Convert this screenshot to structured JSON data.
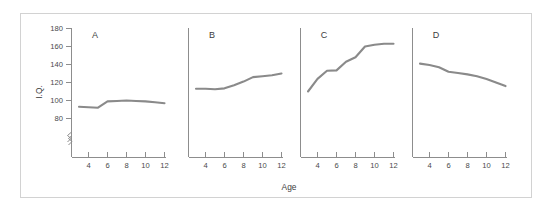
{
  "chart_data": {
    "type": "line",
    "title": "",
    "subtitle": "",
    "xlabel": "Age",
    "ylabel": "I.Q.",
    "xlim": [
      2.4,
      12.6
    ],
    "ylim": [
      72,
      180
    ],
    "yaxis_break": true,
    "grid": false,
    "legend": "none",
    "layout": "1x4 panels sharing y-axis scale",
    "xticks": [
      4,
      6,
      8,
      10,
      12
    ],
    "xtick_labels": [
      "4",
      "6",
      "8",
      "10",
      "12"
    ],
    "yticks": [
      80,
      100,
      120,
      140,
      160,
      180
    ],
    "ytick_labels": [
      "80",
      "100",
      "120",
      "140",
      "160",
      "180"
    ],
    "line_color": "#8a8a8a",
    "panels": [
      {
        "label": "A",
        "description": "flat near average I.Q.",
        "x": [
          3,
          4,
          5,
          6,
          7,
          8,
          9,
          10,
          11,
          12
        ],
        "y": [
          93,
          92.5,
          92,
          99,
          99.5,
          100,
          99.5,
          99,
          98,
          97
        ]
      },
      {
        "label": "B",
        "description": "gradual rise",
        "x": [
          3,
          4,
          5,
          6,
          7,
          8,
          9,
          10,
          11,
          12
        ],
        "y": [
          113,
          113,
          112.5,
          113.5,
          117,
          121,
          126,
          127,
          128,
          130
        ]
      },
      {
        "label": "C",
        "description": "steep rise then plateau",
        "x": [
          3,
          4,
          5,
          6,
          7,
          8,
          9,
          10,
          11,
          12
        ],
        "y": [
          110,
          124,
          133,
          133.5,
          143,
          148,
          160,
          162,
          163,
          163
        ]
      },
      {
        "label": "D",
        "description": "steady decline",
        "x": [
          3,
          4,
          5,
          6,
          7,
          8,
          9,
          10,
          11,
          12
        ],
        "y": [
          141,
          139.5,
          137,
          132,
          130.5,
          129,
          127,
          124,
          120,
          116
        ]
      }
    ]
  },
  "axes": {
    "y_title": "I.Q.",
    "x_title": "Age"
  },
  "panel_letters": {
    "a": "A",
    "b": "B",
    "c": "C",
    "d": "D"
  },
  "ytick_text": {
    "t80": "80",
    "t100": "100",
    "t120": "120",
    "t140": "140",
    "t160": "160",
    "t180": "180"
  },
  "xtick_text": {
    "t4": "4",
    "t6": "6",
    "t8": "8",
    "t10": "10",
    "t12": "12"
  }
}
